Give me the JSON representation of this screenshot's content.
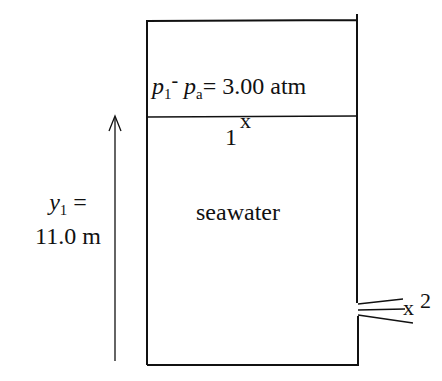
{
  "diagram": {
    "pressure_label": {
      "p1": "p",
      "p1_sub": "1",
      "dash": "-",
      "pa": "p",
      "pa_sub": "a",
      "rest": "= 3.00 atm"
    },
    "point1": {
      "label": "1",
      "marker": "x"
    },
    "point2": {
      "marker": "x",
      "label": "2"
    },
    "height_label": {
      "var": "y",
      "sub": "1",
      "eq": "=",
      "value": "11.0 m"
    },
    "fluid_label": "seawater",
    "colors": {
      "line": "#111111",
      "background": "#ffffff"
    }
  }
}
